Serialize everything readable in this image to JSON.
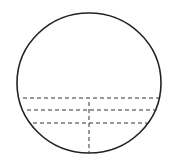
{
  "diagram": {
    "type": "circle-with-chords",
    "stroke_color": "#222222",
    "dash_color": "#333333",
    "circle": {
      "cx": 89,
      "cy": 83,
      "rx": 72,
      "ry": 70,
      "stroke_width": 1.6
    },
    "chords": [
      {
        "y": 98,
        "x1": 23,
        "x2": 159
      },
      {
        "y": 110,
        "x1": 27,
        "x2": 155
      },
      {
        "y": 123,
        "x1": 33,
        "x2": 147
      }
    ],
    "vertical_line": {
      "x": 89,
      "y1": 102,
      "y2": 153
    },
    "dash_pattern": "4 3"
  }
}
